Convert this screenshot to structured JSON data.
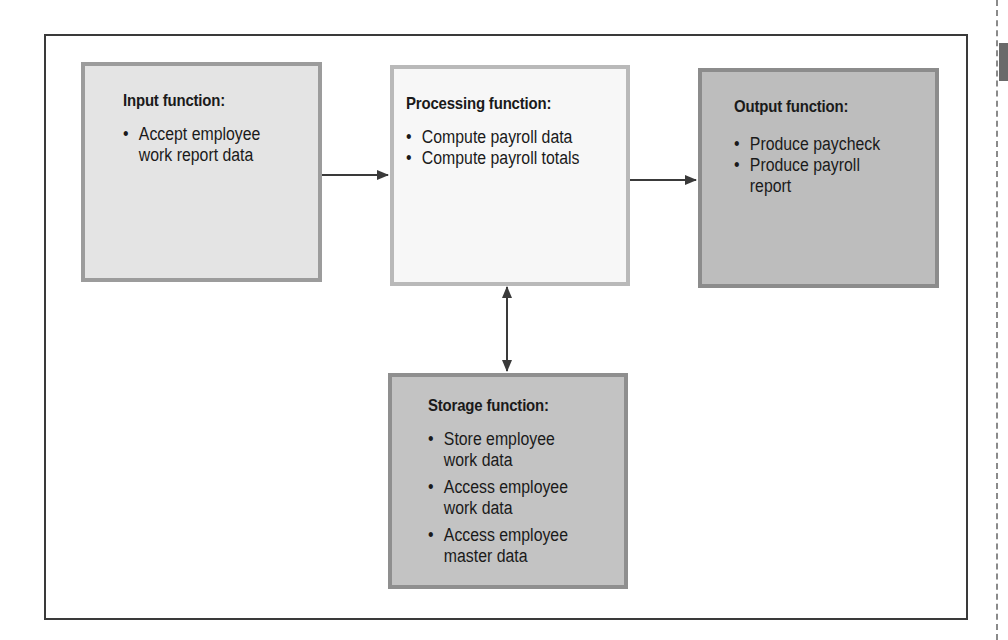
{
  "diagram": {
    "input": {
      "title": "Input function:",
      "items": [
        "Accept employee",
        "work report data"
      ],
      "bullets": [
        "Accept employee work report data"
      ],
      "fill": "#e4e4e4"
    },
    "processing": {
      "title": "Processing function:",
      "bullets": [
        "Compute payroll data",
        "Compute payroll totals"
      ],
      "fill": "#f7f7f7"
    },
    "output": {
      "title": "Output function:",
      "bullets": [
        "Produce paycheck",
        "Produce payroll",
        "report"
      ],
      "fill": "#bdbdbd"
    },
    "storage": {
      "title": "Storage function:",
      "lines": [
        "Store employee",
        "work data",
        "Access employee",
        "work data",
        "Access employee",
        "master data"
      ],
      "fill": "#c3c3c3"
    },
    "arrows": [
      {
        "from": "input",
        "to": "processing",
        "type": "one-way"
      },
      {
        "from": "processing",
        "to": "output",
        "type": "one-way"
      },
      {
        "from": "processing",
        "to": "storage",
        "type": "two-way"
      }
    ]
  }
}
